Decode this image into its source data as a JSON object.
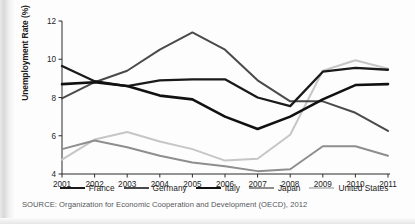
{
  "figure": {
    "source_note": "SOURCE: Organization for Economic Cooperation and Development (OECD), 2012"
  },
  "chart_data": {
    "type": "line",
    "title": "",
    "subtitle": "",
    "xlabel": "",
    "ylabel": "Unemployment Rate (%)",
    "x": [
      2001,
      2002,
      2003,
      2004,
      2005,
      2006,
      2007,
      2008,
      2009,
      2010,
      2011
    ],
    "categories": [
      "2001",
      "2002",
      "2003",
      "2004",
      "2005",
      "2006",
      "2007",
      "2008",
      "2009",
      "2010",
      "2011"
    ],
    "xlim": [
      2001,
      2011
    ],
    "ylim": [
      4,
      12
    ],
    "yticks": [
      4,
      6,
      8,
      10,
      12
    ],
    "ytick_labels": [
      "4",
      "6",
      "8",
      "10",
      "12"
    ],
    "grid": false,
    "legend_position": "bottom",
    "series": [
      {
        "name": "France",
        "color": "#1a1a1a",
        "width": 2.3,
        "values": [
          9.65,
          8.85,
          8.6,
          8.9,
          8.95,
          8.95,
          8.0,
          7.55,
          9.35,
          9.55,
          9.45
        ]
      },
      {
        "name": "Germany",
        "color": "#4a4a4a",
        "width": 2.0,
        "values": [
          7.95,
          8.8,
          9.4,
          10.5,
          11.4,
          10.5,
          8.9,
          7.8,
          7.8,
          7.2,
          6.25
        ]
      },
      {
        "name": "Italy",
        "color": "#111111",
        "width": 2.6,
        "values": [
          8.7,
          8.8,
          8.6,
          8.1,
          7.9,
          7.0,
          6.35,
          7.0,
          7.9,
          8.65,
          8.7
        ]
      },
      {
        "name": "Japan",
        "color": "#8e8e8e",
        "width": 2.0,
        "values": [
          5.3,
          5.75,
          5.4,
          4.95,
          4.6,
          4.4,
          4.15,
          4.25,
          5.45,
          5.45,
          4.95
        ]
      },
      {
        "name": "United States",
        "color": "#c6c6c6",
        "width": 2.0,
        "values": [
          4.75,
          5.8,
          6.2,
          5.7,
          5.3,
          4.7,
          4.8,
          6.05,
          9.4,
          9.95,
          9.5
        ]
      }
    ]
  },
  "legend": {
    "items": [
      {
        "label": "France"
      },
      {
        "label": "Germany"
      },
      {
        "label": "Italy"
      },
      {
        "label": "Japan"
      },
      {
        "label": "United States"
      }
    ]
  }
}
